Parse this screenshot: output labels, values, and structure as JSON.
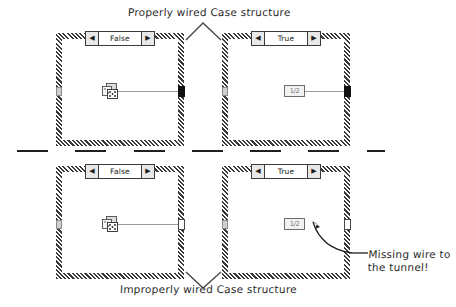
{
  "figure": {
    "title_top": "Properly wired Case structure",
    "title_bottom": "Improperly wired Case structure",
    "callout_note": "Missing wire to the tunnel!"
  },
  "colors": {
    "ink": "#2b2b2b",
    "frame": "#3a3a3a",
    "wire": "#9a9a9a",
    "tunnel_wired": "#111111",
    "tunnel_unwired": "#ffffff",
    "node_fill": "#f2f2f2"
  },
  "cases": [
    {
      "id": "top-false",
      "group": "properly-wired",
      "selector_label": "False",
      "left_arrow": "◀",
      "right_arrow": "▶",
      "node": {
        "type": "random-number-function",
        "label": ""
      },
      "wire_present": true,
      "output_tunnel_state": "wired"
    },
    {
      "id": "top-true",
      "group": "properly-wired",
      "selector_label": "True",
      "left_arrow": "◀",
      "right_arrow": "▶",
      "node": {
        "type": "numeric-constant",
        "label": "1/2"
      },
      "wire_present": true,
      "output_tunnel_state": "wired"
    },
    {
      "id": "bottom-false",
      "group": "improperly-wired",
      "selector_label": "False",
      "left_arrow": "◀",
      "right_arrow": "▶",
      "node": {
        "type": "random-number-function",
        "label": ""
      },
      "wire_present": true,
      "output_tunnel_state": "unwired"
    },
    {
      "id": "bottom-true",
      "group": "improperly-wired",
      "selector_label": "True",
      "left_arrow": "◀",
      "right_arrow": "▶",
      "node": {
        "type": "numeric-constant",
        "label": "1/2"
      },
      "wire_present": false,
      "output_tunnel_state": "unwired"
    }
  ]
}
